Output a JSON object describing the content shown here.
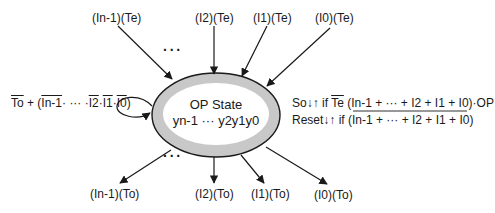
{
  "state": {
    "title": "OP State",
    "bits": "yn-1 ··· y2y1y0",
    "ring_color": "#c8c8c8",
    "stroke_color": "#1a1a1a"
  },
  "inputs_top": [
    {
      "label": "(In-1)(Te)"
    },
    {
      "label": "(I2)(Te)"
    },
    {
      "label": "(I1)(Te)"
    },
    {
      "label": "(I0)(Te)"
    }
  ],
  "outputs_bottom": [
    {
      "label": "(In-1)(To)"
    },
    {
      "label": "(I2)(To)"
    },
    {
      "label": "(I1)(To)"
    },
    {
      "label": "(I0)(To)"
    }
  ],
  "ellipsis": "···",
  "self_loop": {
    "to_bar": "To",
    "plus_open": " + (",
    "in1_bar": "In-1",
    "mid": "·  ···  ·",
    "i2_bar": "I2",
    "dot1": "·",
    "i1_bar": "I1",
    "dot2": "·",
    "i0_bar": "I0",
    "close": ")"
  },
  "conditions": {
    "so": {
      "prefix": "So↓↑ if ",
      "te_bar": "Te",
      "rest": " (In-1 + ··· + I2 + I1 + I0)·OP"
    },
    "reset": {
      "prefix": "Reset↓↑ if ",
      "expr_bar": "(In-1 + ··· + I2 + I1 + I0)"
    }
  }
}
